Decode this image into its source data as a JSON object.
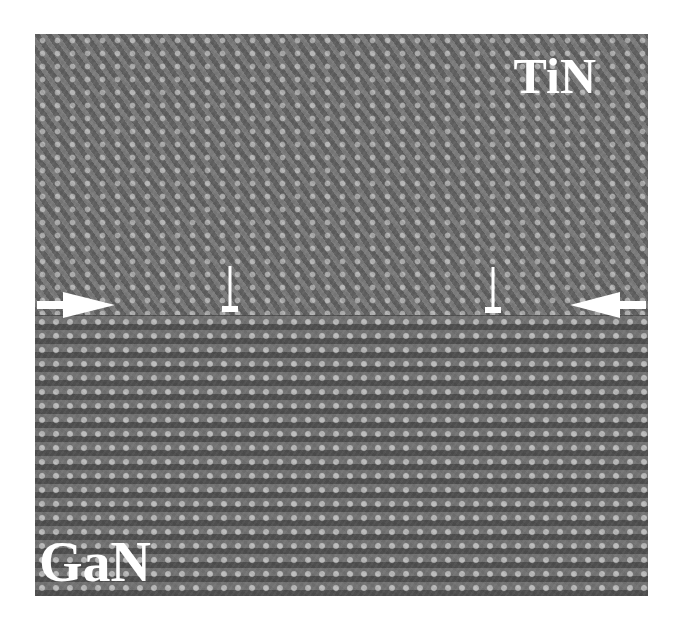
{
  "figure": {
    "type": "HRTEM micrograph",
    "labels": {
      "top_material": "TiN",
      "bottom_material": "GaN"
    },
    "annotations": {
      "interface_arrows": [
        "arrow-right-pointing",
        "arrow-left-pointing"
      ],
      "dislocation_symbols": [
        "⊥",
        "⊥"
      ]
    },
    "colors": {
      "background": "#ffffff",
      "label_color": "#ffffff",
      "image_gray": "#6e6e6e"
    }
  }
}
